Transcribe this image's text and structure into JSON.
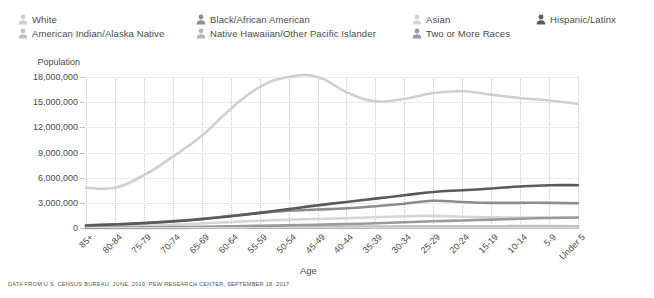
{
  "legend": {
    "items": [
      {
        "label": "White",
        "color": "#cfcfcf",
        "icon": "person-icon",
        "col": 0,
        "row": 0
      },
      {
        "label": "American Indian/Alaska Native",
        "color": "#c2c2c2",
        "icon": "person-icon",
        "col": 0,
        "row": 1
      },
      {
        "label": "Black/African American",
        "color": "#8c8c8c",
        "icon": "person-icon",
        "col": 1,
        "row": 0
      },
      {
        "label": "Native Hawaiian/Other Pacific Islander",
        "color": "#b5b5b5",
        "icon": "person-icon",
        "col": 1,
        "row": 1
      },
      {
        "label": "Asian",
        "color": "#d5d5d5",
        "icon": "person-icon",
        "col": 2,
        "row": 0
      },
      {
        "label": "Two or More Races",
        "color": "#9a9a9a",
        "icon": "person-icon",
        "col": 2,
        "row": 1
      },
      {
        "label": "Hispanic/Latinx",
        "color": "#5a5a5a",
        "icon": "person-icon",
        "col": 3,
        "row": 0
      }
    ]
  },
  "axis": {
    "y_title": "Population",
    "x_title": "Age",
    "y_ticks": [
      "18,000,000",
      "15,000,000",
      "12,000,000",
      "9,000,000",
      "6,000,000",
      "3,000,000",
      "0"
    ]
  },
  "footer": {
    "source": "DATA FROM U.S. CENSUS BUREAU, JUNE, 2019; PEW RESEARCH CENTER, SEPTEMBER 18, 2017"
  },
  "chart_data": {
    "type": "line",
    "title": "",
    "xlabel": "Age",
    "ylabel": "Population",
    "ylim": [
      0,
      18000000
    ],
    "ytick_values": [
      0,
      3000000,
      6000000,
      9000000,
      12000000,
      15000000,
      18000000
    ],
    "grid": true,
    "legend_position": "top",
    "categories": [
      "85+",
      "80-84",
      "75-79",
      "70-74",
      "65-69",
      "60-64",
      "55-59",
      "50-54",
      "45-49",
      "40-44",
      "35-39",
      "30-34",
      "25-29",
      "20-24",
      "15-19",
      "10-14",
      "5-9",
      "Under 5"
    ],
    "series": [
      {
        "name": "White",
        "color": "#cfcfcf",
        "values": [
          4800000,
          4800000,
          6300000,
          8500000,
          11000000,
          14200000,
          16800000,
          18000000,
          18000000,
          16200000,
          15100000,
          15400000,
          16100000,
          16300000,
          15900000,
          15500000,
          15200000,
          14800000
        ]
      },
      {
        "name": "Hispanic/Latinx",
        "color": "#5a5a5a",
        "values": [
          300000,
          420000,
          580000,
          780000,
          1050000,
          1400000,
          1800000,
          2250000,
          2700000,
          3100000,
          3500000,
          3900000,
          4300000,
          4500000,
          4700000,
          4950000,
          5100000,
          5100000
        ]
      },
      {
        "name": "Black/African American",
        "color": "#8c8c8c",
        "values": [
          330000,
          440000,
          600000,
          820000,
          1100000,
          1450000,
          1800000,
          2050000,
          2200000,
          2350000,
          2600000,
          2900000,
          3250000,
          3100000,
          3000000,
          3000000,
          3000000,
          2950000
        ]
      },
      {
        "name": "Asian",
        "color": "#d5d5d5",
        "values": [
          130000,
          180000,
          250000,
          380000,
          540000,
          720000,
          870000,
          990000,
          1080000,
          1180000,
          1280000,
          1400000,
          1450000,
          1350000,
          1280000,
          1250000,
          1250000,
          1200000
        ]
      },
      {
        "name": "Two or More Races",
        "color": "#9a9a9a",
        "values": [
          50000,
          60000,
          80000,
          110000,
          150000,
          200000,
          260000,
          320000,
          390000,
          470000,
          560000,
          680000,
          800000,
          900000,
          1000000,
          1100000,
          1200000,
          1250000
        ]
      },
      {
        "name": "American Indian/Alaska Native",
        "color": "#c2c2c2",
        "values": [
          25000,
          32000,
          45000,
          62000,
          85000,
          110000,
          135000,
          150000,
          160000,
          170000,
          180000,
          195000,
          210000,
          215000,
          215000,
          220000,
          220000,
          215000
        ]
      },
      {
        "name": "Native Hawaiian/Other Pacific Islander",
        "color": "#b5b5b5",
        "values": [
          6000,
          8000,
          11000,
          15000,
          21000,
          28000,
          34000,
          39000,
          43000,
          47000,
          52000,
          58000,
          64000,
          66000,
          66000,
          68000,
          70000,
          70000
        ]
      }
    ]
  }
}
